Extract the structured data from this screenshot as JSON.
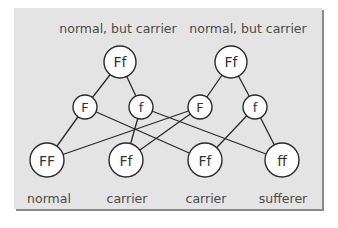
{
  "diagram": {
    "type": "genetic-inheritance-cross",
    "parents": [
      {
        "id": "p1",
        "label": "normal, but carrier",
        "genotype": "Ff",
        "x": 120,
        "y": 62
      },
      {
        "id": "p2",
        "label": "normal, but carrier",
        "genotype": "Ff",
        "x": 231,
        "y": 62
      }
    ],
    "gametes": [
      {
        "id": "g1",
        "allele": "F",
        "x": 85,
        "y": 107
      },
      {
        "id": "g2",
        "allele": "f",
        "x": 141,
        "y": 107
      },
      {
        "id": "g3",
        "allele": "F",
        "x": 200,
        "y": 107
      },
      {
        "id": "g4",
        "allele": "f",
        "x": 255,
        "y": 107
      }
    ],
    "offspring": [
      {
        "id": "o1",
        "genotype": "FF",
        "label": "normal",
        "x": 47,
        "y": 160
      },
      {
        "id": "o2",
        "genotype": "Ff",
        "label": "carrier",
        "x": 126,
        "y": 160
      },
      {
        "id": "o3",
        "genotype": "Ff",
        "label": "carrier",
        "x": 205,
        "y": 160
      },
      {
        "id": "o4",
        "genotype": "ff",
        "label": "sufferer",
        "x": 282,
        "y": 160
      }
    ],
    "edges": [
      [
        "p1",
        "g1"
      ],
      [
        "p1",
        "g2"
      ],
      [
        "p2",
        "g3"
      ],
      [
        "p2",
        "g4"
      ],
      [
        "g1",
        "o1"
      ],
      [
        "g1",
        "o3"
      ],
      [
        "g2",
        "o2"
      ],
      [
        "g2",
        "o4"
      ],
      [
        "g3",
        "o1"
      ],
      [
        "g3",
        "o2"
      ],
      [
        "g4",
        "o3"
      ],
      [
        "g4",
        "o4"
      ]
    ],
    "colors": {
      "panel": "#e4e4e4",
      "node_fill": "#ffffff",
      "stroke": "#2a2a2a",
      "text": "#4a4a4a",
      "shadow": "#8a8a8a"
    }
  }
}
